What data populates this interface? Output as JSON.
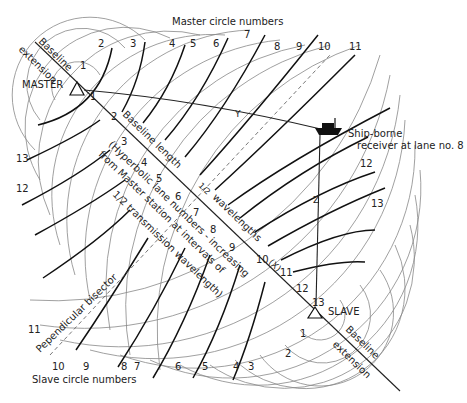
{
  "labels": {
    "master_circle_numbers": "Master circle numbers",
    "slave_circle_numbers": "Slave circle numbers",
    "master": "MASTER",
    "slave": "SLAVE",
    "baseline_ext_top_1": "Baseline",
    "baseline_ext_top_2": "extension",
    "baseline_ext_bottom_1": "Baseline",
    "baseline_ext_bottom_2": "extension",
    "baseline_length": "Baseline length",
    "half_wavelengths_a": "6",
    "half_wavelengths_frac": "1/2",
    "half_wavelengths_b": "wavelengths",
    "hyperbolic_note_1": "(Hyperbolic lane numbers - increasing",
    "hyperbolic_note_2": "from Master station at intervals of",
    "hyperbolic_note_3": "1/2 transmission wavelength)",
    "perp_bisector": "Pependicular bisector",
    "ship_1": "Ship-borne",
    "ship_2": "receiver at lane no. 8",
    "point_y": "Y",
    "point_z": "Z",
    "point_x": "(X)"
  },
  "master_numbers": [
    "1",
    "2",
    "3",
    "4",
    "5",
    "6",
    "7",
    "8",
    "9",
    "10",
    "11"
  ],
  "slave_numbers": [
    "10",
    "9",
    "8",
    "7",
    "6",
    "5",
    "4",
    "3",
    "2",
    "1"
  ],
  "left_numbers": [
    "13",
    "12",
    "11"
  ],
  "right_numbers": [
    "12",
    "13"
  ],
  "baseline_lane_numbers": [
    "1",
    "2",
    "3",
    "4",
    "5",
    "6",
    "7",
    "8",
    "9",
    "10",
    "11",
    "12",
    "13"
  ]
}
